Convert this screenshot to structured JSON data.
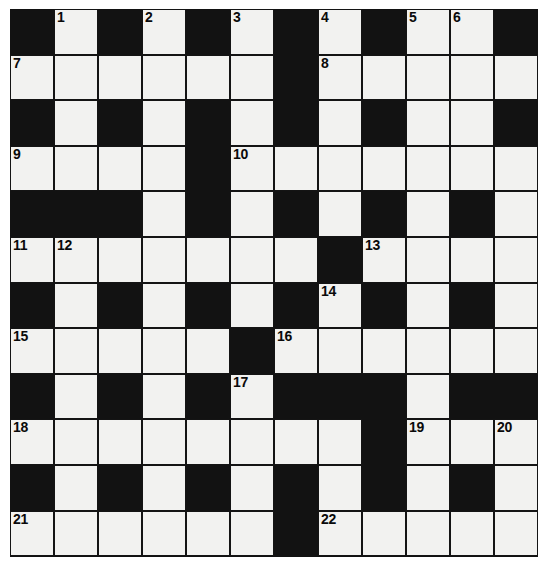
{
  "puzzle": {
    "title": "Crossword Grid",
    "type": "crossword-grid",
    "rows": 12,
    "columns": 12,
    "cell_size_px": 44,
    "colors": {
      "block": "#121212",
      "cell": "#f2f2f0",
      "grid_line": "#141414",
      "number_text": "#0a0a0a",
      "page_background": "#ffffff"
    },
    "legend": {
      "white": "open letter square",
      "black": "blocked square"
    },
    "grid": [
      [
        "black",
        "white",
        "black",
        "white",
        "black",
        "white",
        "black",
        "white",
        "black",
        "white",
        "white",
        "black"
      ],
      [
        "white",
        "white",
        "white",
        "white",
        "white",
        "white",
        "black",
        "white",
        "white",
        "white",
        "white",
        "white"
      ],
      [
        "black",
        "white",
        "black",
        "white",
        "black",
        "white",
        "black",
        "white",
        "black",
        "white",
        "white",
        "black"
      ],
      [
        "white",
        "white",
        "white",
        "white",
        "black",
        "white",
        "white",
        "white",
        "white",
        "white",
        "white",
        "white"
      ],
      [
        "black",
        "black",
        "black",
        "white",
        "black",
        "white",
        "black",
        "white",
        "black",
        "white",
        "black",
        "white"
      ],
      [
        "white",
        "white",
        "white",
        "white",
        "white",
        "white",
        "white",
        "black",
        "white",
        "white",
        "white",
        "white"
      ],
      [
        "black",
        "white",
        "black",
        "white",
        "black",
        "white",
        "black",
        "white",
        "black",
        "white",
        "black",
        "white"
      ],
      [
        "white",
        "white",
        "white",
        "white",
        "white",
        "black",
        "white",
        "white",
        "white",
        "white",
        "white",
        "white"
      ],
      [
        "black",
        "white",
        "black",
        "white",
        "black",
        "white",
        "black",
        "black",
        "black",
        "white",
        "black",
        "black"
      ],
      [
        "white",
        "white",
        "white",
        "white",
        "white",
        "white",
        "white",
        "white",
        "black",
        "white",
        "white",
        "white"
      ],
      [
        "black",
        "white",
        "black",
        "white",
        "black",
        "white",
        "black",
        "white",
        "black",
        "white",
        "black",
        "white"
      ],
      [
        "white",
        "white",
        "white",
        "white",
        "white",
        "white",
        "black",
        "white",
        "white",
        "white",
        "white",
        "white"
      ]
    ],
    "numbers": [
      {
        "n": 1,
        "row": 0,
        "col": 1
      },
      {
        "n": 2,
        "row": 0,
        "col": 3
      },
      {
        "n": 3,
        "row": 0,
        "col": 5
      },
      {
        "n": 4,
        "row": 0,
        "col": 7
      },
      {
        "n": 5,
        "row": 0,
        "col": 9
      },
      {
        "n": 6,
        "row": 0,
        "col": 10
      },
      {
        "n": 7,
        "row": 1,
        "col": 0
      },
      {
        "n": 8,
        "row": 1,
        "col": 7
      },
      {
        "n": 9,
        "row": 3,
        "col": 0
      },
      {
        "n": 10,
        "row": 3,
        "col": 5
      },
      {
        "n": 11,
        "row": 5,
        "col": 0
      },
      {
        "n": 12,
        "row": 5,
        "col": 1
      },
      {
        "n": 13,
        "row": 5,
        "col": 8
      },
      {
        "n": 14,
        "row": 6,
        "col": 7
      },
      {
        "n": 15,
        "row": 7,
        "col": 0
      },
      {
        "n": 16,
        "row": 7,
        "col": 6
      },
      {
        "n": 17,
        "row": 8,
        "col": 5
      },
      {
        "n": 18,
        "row": 9,
        "col": 0
      },
      {
        "n": 19,
        "row": 9,
        "col": 9
      },
      {
        "n": 20,
        "row": 9,
        "col": 11
      },
      {
        "n": 21,
        "row": 11,
        "col": 0
      },
      {
        "n": 22,
        "row": 11,
        "col": 7
      }
    ]
  }
}
